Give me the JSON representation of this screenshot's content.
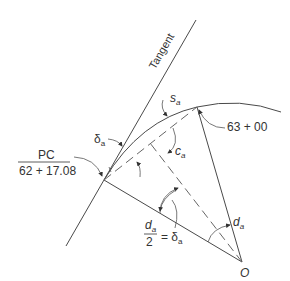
{
  "diagram": {
    "type": "circular-curve-layout",
    "labels": {
      "tangent": "Tangent",
      "pc_title": "PC",
      "pc_station": "62 + 17.08",
      "station_point": "63 + 00",
      "s_a": "s",
      "s_a_sub": "a",
      "c_a": "c",
      "c_a_sub": "a",
      "delta_a": "δ",
      "delta_a_sub": "a",
      "d_a": "d",
      "d_a_sub": "a",
      "half_d_num": "d",
      "half_d_num_sub": "a",
      "half_d_den": "2",
      "half_d_eq": "= δ",
      "half_d_eq_sub": "a",
      "center": "O"
    },
    "colors": {
      "line": "#4a4a4a",
      "text": "#333333",
      "background": "#ffffff"
    }
  }
}
